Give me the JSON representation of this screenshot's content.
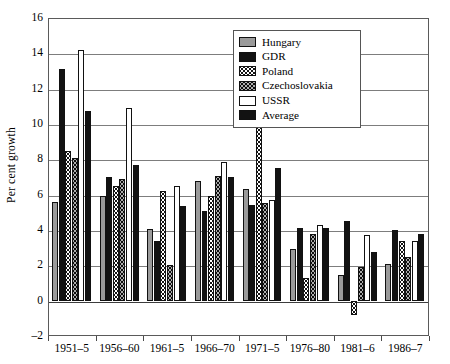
{
  "chart_data": {
    "type": "bar",
    "title": "",
    "xlabel": "",
    "ylabel": "Per cent growth",
    "ylim": [
      -2,
      16
    ],
    "ytick_step": 2,
    "yticks": [
      16,
      14,
      12,
      10,
      8,
      6,
      4,
      2,
      0,
      -2
    ],
    "grid": true,
    "legend_position": "top-right",
    "categories": [
      "1951–5",
      "1956–60",
      "1961–5",
      "1966–70",
      "1971–5",
      "1976–80",
      "1981–6",
      "1986–7"
    ],
    "series": [
      {
        "name": "Hungary",
        "color": "#9a9a9a",
        "pattern": "solid-gray",
        "values": [
          5.6,
          5.9,
          4.05,
          6.8,
          6.3,
          2.9,
          1.45,
          2.1
        ]
      },
      {
        "name": "GDR",
        "color": "#121212",
        "pattern": "solid-black",
        "values": [
          13.1,
          7.0,
          3.4,
          5.1,
          5.4,
          4.1,
          4.5,
          4.0
        ]
      },
      {
        "name": "Poland",
        "color": "#ffffff",
        "pattern": "fine-dots",
        "values": [
          8.45,
          6.5,
          6.2,
          5.95,
          9.85,
          1.3,
          -0.8,
          3.4
        ]
      },
      {
        "name": "Czechoslovakia",
        "color": "#ffffff",
        "pattern": "coarse-dots",
        "values": [
          8.1,
          6.9,
          2.0,
          7.05,
          5.55,
          3.8,
          1.9,
          2.45
        ]
      },
      {
        "name": "USSR",
        "color": "#ffffff",
        "pattern": "white",
        "values": [
          14.2,
          10.9,
          6.5,
          7.85,
          5.7,
          4.3,
          3.7,
          3.35
        ]
      },
      {
        "name": "Average",
        "color": "#121212",
        "pattern": "solid-black",
        "values": [
          10.75,
          7.7,
          5.35,
          7.0,
          7.5,
          4.1,
          2.75,
          3.8
        ]
      }
    ]
  },
  "legend": {
    "items": [
      {
        "label": "Hungary"
      },
      {
        "label": "GDR"
      },
      {
        "label": "Poland"
      },
      {
        "label": "Czechoslovakia"
      },
      {
        "label": "USSR"
      },
      {
        "label": "Average"
      }
    ]
  },
  "axis": {
    "y_title": "Per cent growth"
  }
}
